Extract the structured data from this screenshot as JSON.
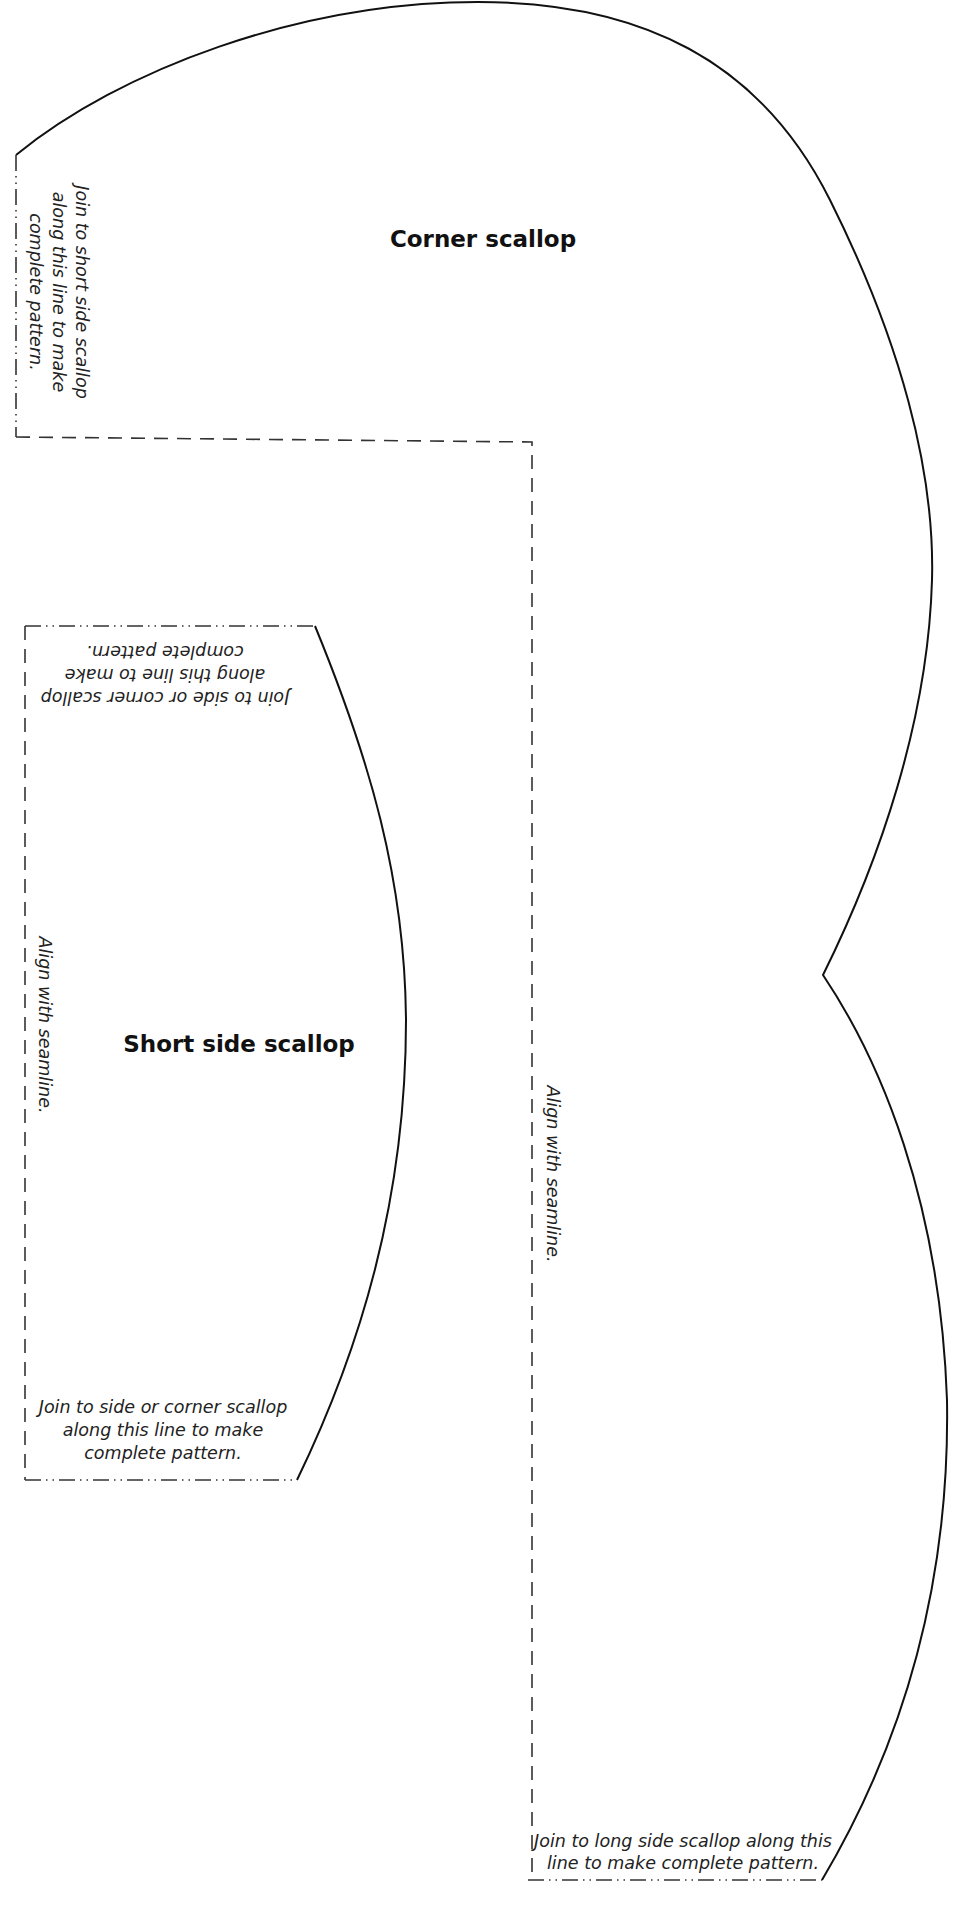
{
  "pattern": {
    "pieces": [
      {
        "id": "corner",
        "title": "Corner scallop",
        "join_note_lines": [
          "Join to short side scallop",
          "along this line to make",
          "complete pattern."
        ],
        "seam_note": "Align with seamline.",
        "bottom_note_lines": [
          "Join to long side scallop along this",
          "line to make complete pattern."
        ]
      },
      {
        "id": "short-side",
        "title": "Short side scallop",
        "top_note_lines": [
          "Join to side or corner scallop",
          "along this line to make",
          "complete pattern."
        ],
        "seam_note": "Align with seamline.",
        "bottom_note_lines": [
          "Join to side or corner scallop",
          "along this line to make",
          "complete pattern."
        ]
      }
    ],
    "colors": {
      "line": "#111111",
      "dash": "#333333",
      "background": "#ffffff"
    }
  }
}
